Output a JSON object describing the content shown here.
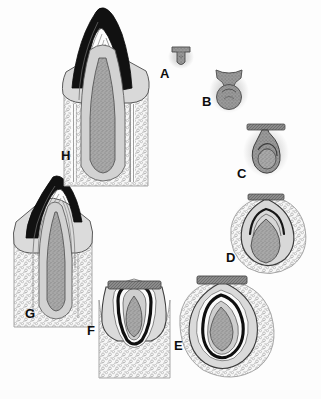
{
  "figure": {
    "width": 321,
    "height": 399,
    "background_color": "#fdfdfd"
  },
  "palette": {
    "background": "#fdfdfd",
    "enamel_black": "#101010",
    "dentin_gray": "#b9b9b9",
    "pulp_stipple": "#8e8e8e",
    "halo_light": "#e4e4e4",
    "bone_outline": "#9a9a9a",
    "bone_fill": "#f2f2f2",
    "lamina_bar": "#7d7d7d",
    "label_color": "#0d0d0d",
    "line_dark": "#2b2b2b",
    "line_mid": "#6f6f6f"
  },
  "labels": [
    {
      "id": "A",
      "text": "A",
      "x": 160,
      "y": 67,
      "stage": "bud-stage"
    },
    {
      "id": "B",
      "text": "B",
      "x": 202,
      "y": 95,
      "stage": "cap-stage"
    },
    {
      "id": "C",
      "text": "C",
      "x": 237,
      "y": 167,
      "stage": "early-bell-stage"
    },
    {
      "id": "D",
      "text": "D",
      "x": 226,
      "y": 251,
      "stage": "late-bell-stage"
    },
    {
      "id": "E",
      "text": "E",
      "x": 174,
      "y": 339,
      "stage": "crown-formation"
    },
    {
      "id": "F",
      "text": "F",
      "x": 87,
      "y": 324,
      "stage": "root-formation"
    },
    {
      "id": "G",
      "text": "G",
      "x": 25,
      "y": 307,
      "stage": "eruption"
    },
    {
      "id": "H",
      "text": "H",
      "x": 61,
      "y": 149,
      "stage": "fully-erupted"
    }
  ],
  "panels": [
    {
      "id": "A",
      "name": "bud-stage",
      "center_x": 180,
      "center_y": 57,
      "scale": 0.3,
      "has_lamina_bar": false,
      "has_bone_crypt": false,
      "has_enamel": false,
      "has_roots": false,
      "halo": true
    },
    {
      "id": "B",
      "name": "cap-stage",
      "center_x": 228,
      "center_y": 88,
      "scale": 0.46,
      "has_lamina_bar": false,
      "has_bone_crypt": false,
      "has_enamel": false,
      "has_roots": false,
      "halo": true
    },
    {
      "id": "C",
      "name": "early-bell-stage",
      "center_x": 265,
      "center_y": 148,
      "scale": 0.62,
      "has_lamina_bar": true,
      "has_bone_crypt": false,
      "has_enamel": false,
      "has_roots": false,
      "halo": true
    },
    {
      "id": "D",
      "name": "late-bell-stage",
      "center_x": 267,
      "center_y": 228,
      "scale": 0.86,
      "has_lamina_bar": true,
      "has_bone_crypt": true,
      "has_enamel": true,
      "has_roots": false,
      "halo": true
    },
    {
      "id": "E",
      "name": "crown-formation",
      "center_x": 222,
      "center_y": 318,
      "scale": 1.0,
      "has_lamina_bar": true,
      "has_bone_crypt": true,
      "has_enamel": true,
      "has_roots": false,
      "halo": true
    },
    {
      "id": "F",
      "name": "root-formation",
      "center_x": 133,
      "center_y": 325,
      "scale": 1.0,
      "has_lamina_bar": true,
      "has_bone_crypt": true,
      "has_enamel": true,
      "has_roots": true,
      "halo": false
    },
    {
      "id": "G",
      "name": "eruption",
      "center_x": 52,
      "center_y": 245,
      "scale": 1.0,
      "has_lamina_bar": false,
      "has_bone_crypt": true,
      "has_enamel": true,
      "has_roots": true,
      "halo": false
    },
    {
      "id": "H",
      "name": "fully-erupted",
      "center_x": 103,
      "center_y": 95,
      "scale": 1.0,
      "has_lamina_bar": false,
      "has_bone_crypt": true,
      "has_enamel": true,
      "has_roots": true,
      "halo": false
    }
  ]
}
